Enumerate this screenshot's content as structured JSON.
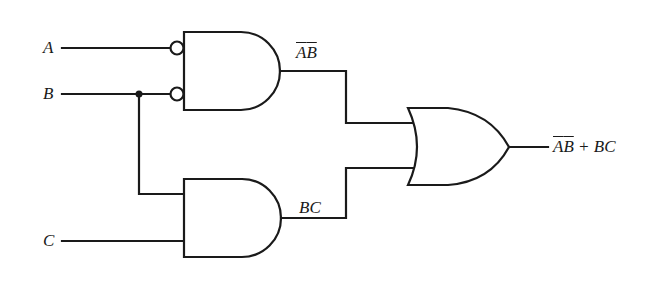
{
  "diagram": {
    "type": "logic-circuit",
    "title": "",
    "colors": {
      "stroke": "#1a1a1a",
      "background": "#ffffff"
    },
    "inputs": [
      {
        "id": "A",
        "label": "A"
      },
      {
        "id": "B",
        "label": "B"
      },
      {
        "id": "C",
        "label": "C"
      }
    ],
    "gates": [
      {
        "id": "and1",
        "type": "AND",
        "inverted_inputs": [
          "A",
          "B"
        ],
        "inputs": [
          "A",
          "B"
        ],
        "output_label_parts": [
          "A",
          "B"
        ],
        "output_label_overlined": [
          true,
          true
        ]
      },
      {
        "id": "and2",
        "type": "AND",
        "inverted_inputs": [],
        "inputs": [
          "B",
          "C"
        ],
        "output_label": "BC"
      },
      {
        "id": "or1",
        "type": "OR",
        "inputs": [
          "and1",
          "and2"
        ]
      }
    ],
    "labels": {
      "input_a": "A",
      "input_b": "B",
      "input_c": "C",
      "and1_out_a": "A",
      "and1_out_b": "B",
      "and2_out": "BC",
      "final_out_a": "A",
      "final_out_b": "B",
      "final_out_rest": " + BC"
    },
    "output_expression": "A̅B̅ + BC"
  }
}
